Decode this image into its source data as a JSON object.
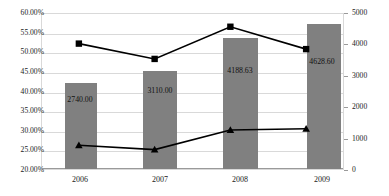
{
  "chart_data": {
    "type": "bar",
    "title": "",
    "subtitle": "",
    "xlabel": "",
    "ylabel": "",
    "categories": [
      "2006",
      "2007",
      "2008",
      "2009"
    ],
    "grid": true,
    "legend": "none",
    "axes": {
      "left": {
        "label": "",
        "min": 0.2,
        "max": 0.6,
        "step": 0.05,
        "format": "percent",
        "ticks": [
          "20.00%",
          "25.00%",
          "30.00%",
          "35.00%",
          "40.00%",
          "45.00%",
          "50.00%",
          "55.00%",
          "60.00%"
        ]
      },
      "right": {
        "label": "",
        "min": 0,
        "max": 5000,
        "step": 1000,
        "ticks": [
          "0",
          "1000",
          "2000",
          "3000",
          "4000",
          "5000"
        ]
      }
    },
    "series": [
      {
        "name": "bars",
        "kind": "bar",
        "axis": "right",
        "color": "#808080",
        "values": [
          2740.0,
          3110.0,
          4188.63,
          4628.6
        ],
        "data_labels": [
          "2740.00",
          "3110.00",
          "4188.63",
          "4628.60"
        ]
      },
      {
        "name": "line-upper",
        "kind": "line",
        "axis": "left",
        "color": "#000000",
        "marker": "square",
        "values": [
          0.522,
          0.483,
          0.565,
          0.508
        ]
      },
      {
        "name": "line-lower",
        "kind": "line",
        "axis": "left",
        "color": "#000000",
        "marker": "triangle",
        "values": [
          0.263,
          0.252,
          0.302,
          0.305
        ]
      }
    ]
  },
  "axis_left": {
    "t0": "60.00%",
    "t1": "55.00%",
    "t2": "50.00%",
    "t3": "45.00%",
    "t4": "40.00%",
    "t5": "35.00%",
    "t6": "30.00%",
    "t7": "25.00%",
    "t8": "20.00%"
  },
  "axis_right": {
    "t0": "5000",
    "t1": "4000",
    "t2": "3000",
    "t3": "2000",
    "t4": "1000",
    "t5": "0"
  },
  "categories": {
    "c0": "2006",
    "c1": "2007",
    "c2": "2008",
    "c3": "2009"
  },
  "bar_labels": {
    "b0": "2740.00",
    "b1": "3110.00",
    "b2": "4188.63",
    "b3": "4628.60"
  }
}
